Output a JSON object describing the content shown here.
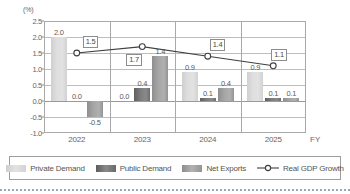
{
  "chart_data": {
    "type": "bar",
    "title": "",
    "subtitle": "",
    "unit_label": "(%)",
    "xlabel": "FY",
    "ylabel": "",
    "categories": [
      "2022",
      "2023",
      "2024",
      "2025"
    ],
    "ylim": [
      -1.0,
      2.5
    ],
    "yticks": [
      "2.5",
      "2.0",
      "1.5",
      "1.0",
      "0.5",
      "0.0",
      "-0.5",
      "-1.0"
    ],
    "ytick_values": [
      2.5,
      2.0,
      1.5,
      1.0,
      0.5,
      0.0,
      -0.5,
      -1.0
    ],
    "grid": true,
    "legend_position": "bottom",
    "stacked": false,
    "series": [
      {
        "name": "Private Demand",
        "type": "bar",
        "color": "#dedede",
        "values": [
          2.0,
          0.0,
          0.9,
          0.9
        ],
        "labels": [
          "2.0",
          "0.0",
          "0.9",
          "0.9"
        ]
      },
      {
        "name": "Public Demand",
        "type": "bar",
        "color": "#7c7c7c",
        "values": [
          0.0,
          0.4,
          0.1,
          0.1
        ],
        "labels": [
          "0.0",
          "0.4",
          "0.1",
          "0.1"
        ]
      },
      {
        "name": "Net Exports",
        "type": "bar",
        "color": "#a6a6a6",
        "values": [
          -0.5,
          1.4,
          0.4,
          0.1
        ],
        "labels": [
          "-0.5",
          "1.4",
          "0.4",
          "0.1"
        ]
      },
      {
        "name": "Real GDP Growth",
        "type": "line",
        "color": "#3f3f3f",
        "marker": "open-circle",
        "values": [
          1.5,
          1.7,
          1.4,
          1.1
        ],
        "labels": [
          "1.5",
          "1.7",
          "1.4",
          "1.1"
        ]
      }
    ]
  },
  "legend": {
    "items": [
      {
        "label": "Private Demand",
        "swatch": "private-demand-swatch"
      },
      {
        "label": "Public Demand",
        "swatch": "public-demand-swatch"
      },
      {
        "label": "Net Exports",
        "swatch": "net-exports-swatch"
      },
      {
        "label": "Real GDP Growth",
        "swatch": "real-gdp-growth-line-marker"
      }
    ]
  }
}
